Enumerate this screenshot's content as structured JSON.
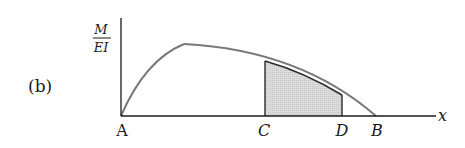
{
  "figure": {
    "panel_label": "(b)",
    "y_axis": {
      "label_numerator": "M",
      "label_denominator": "EI"
    },
    "x_axis": {
      "label": "x"
    },
    "points": {
      "A": "A",
      "C": "C",
      "D": "D",
      "B": "B"
    },
    "colors": {
      "curve": "#7a7a7a",
      "axes": "#1a1a1a",
      "shade": "#d8d8d8"
    }
  }
}
